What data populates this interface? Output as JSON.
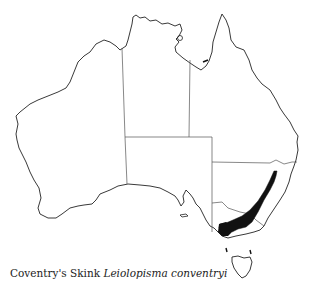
{
  "figure": {
    "type": "distribution-map",
    "region": "Australia",
    "caption": {
      "common_name": "Coventry's Skink",
      "scientific_name": "Leiolopisma conventryi"
    },
    "colors": {
      "outline": "#222222",
      "border": "#555555",
      "range": "#111111",
      "background": "#ffffff"
    },
    "range_description": "South-eastern Australia: eastern Victoria highlands extending north-east into south-eastern New South Wales"
  }
}
